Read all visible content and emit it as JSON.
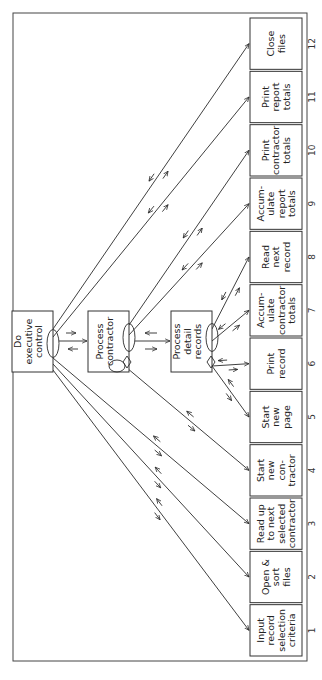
{
  "diagram": {
    "type": "structure-chart",
    "orientation": "rotated-90-clockwise",
    "control_modules": [
      {
        "id": "exec",
        "label": [
          "Do",
          "executive",
          "control"
        ]
      },
      {
        "id": "contractor",
        "label": [
          "Process",
          "contractor"
        ]
      },
      {
        "id": "detail",
        "label": [
          "Process",
          "detail",
          "records"
        ]
      }
    ],
    "leaf_modules": [
      {
        "num": "1",
        "label": [
          "Input",
          "record",
          "selection",
          "criteria"
        ],
        "parent": "exec"
      },
      {
        "num": "2",
        "label": [
          "Open &",
          "sort",
          "files"
        ],
        "parent": "exec"
      },
      {
        "num": "3",
        "label": [
          "Read up",
          "to next",
          "selected",
          "contractor"
        ],
        "parent": "exec"
      },
      {
        "num": "4",
        "label": [
          "Start",
          "new",
          "con-",
          "tractor"
        ],
        "parent": "contractor"
      },
      {
        "num": "5",
        "label": [
          "Start",
          "new",
          "page"
        ],
        "parent": "detail"
      },
      {
        "num": "6",
        "label": [
          "Print",
          "record"
        ],
        "parent": "detail"
      },
      {
        "num": "7",
        "label": [
          "Accum-",
          "ulate",
          "contractor",
          "totals"
        ],
        "parent": "detail"
      },
      {
        "num": "8",
        "label": [
          "Read",
          "next",
          "record"
        ],
        "parent": "detail"
      },
      {
        "num": "9",
        "label": [
          "Accum-",
          "ulate",
          "report",
          "totals"
        ],
        "parent": "contractor"
      },
      {
        "num": "10",
        "label": [
          "Print",
          "contractor",
          "totals"
        ],
        "parent": "contractor"
      },
      {
        "num": "11",
        "label": [
          "Print",
          "report",
          "totals"
        ],
        "parent": "exec"
      },
      {
        "num": "12",
        "label": [
          "Close",
          "files"
        ],
        "parent": "exec"
      }
    ],
    "line_color": "#2a2a2a",
    "background": "#ffffff"
  }
}
